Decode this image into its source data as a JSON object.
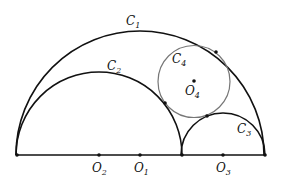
{
  "diagram": {
    "baseline": {
      "y": 155,
      "x_start": 17,
      "x_end": 265
    },
    "circles": [
      {
        "id": "C1",
        "label": "C",
        "sub": "1",
        "cx": 140,
        "cy": 155,
        "r": 124,
        "type": "semicircle",
        "color": "#111111",
        "label_x": 126,
        "label_y": 25
      },
      {
        "id": "C2",
        "label": "C",
        "sub": "2",
        "cx": 99,
        "cy": 155,
        "r": 83,
        "type": "semicircle",
        "color": "#111111",
        "label_x": 107,
        "label_y": 70
      },
      {
        "id": "C3",
        "label": "C",
        "sub": "3",
        "cx": 223,
        "cy": 155,
        "r": 42,
        "type": "semicircle",
        "color": "#111111",
        "label_x": 237,
        "label_y": 133
      },
      {
        "id": "C4",
        "label": "C",
        "sub": "4",
        "cx": 194,
        "cy": 81.5,
        "r": 36,
        "type": "circle",
        "color": "#777777",
        "label_x": 172,
        "label_y": 63
      }
    ],
    "points": [
      {
        "name": "left-end",
        "x": 17,
        "y": 155
      },
      {
        "name": "O2",
        "x": 99,
        "y": 155
      },
      {
        "name": "O1",
        "x": 140,
        "y": 155
      },
      {
        "name": "mid",
        "x": 182,
        "y": 155
      },
      {
        "name": "O3",
        "x": 223,
        "y": 155
      },
      {
        "name": "right-end",
        "x": 265,
        "y": 155
      },
      {
        "name": "O4",
        "x": 194,
        "y": 81
      },
      {
        "name": "tangent-C4-C1",
        "x": 216,
        "y": 52
      },
      {
        "name": "tangent-C4-C2",
        "x": 165,
        "y": 103
      },
      {
        "name": "tangent-C4-C3",
        "x": 207,
        "y": 116
      }
    ],
    "labels": [
      {
        "text": "O",
        "sub": "2",
        "x": 92,
        "y": 172
      },
      {
        "text": "O",
        "sub": "1",
        "x": 134,
        "y": 172
      },
      {
        "text": "O",
        "sub": "3",
        "x": 216,
        "y": 172
      },
      {
        "text": "O",
        "sub": "4",
        "x": 185,
        "y": 95
      }
    ]
  }
}
